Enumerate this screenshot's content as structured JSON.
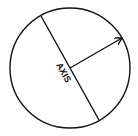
{
  "diagram": {
    "label": "AXIS",
    "stroke_color": "#111111",
    "background": "#ffffff",
    "circle": {
      "cx": 70,
      "cy": 68,
      "r": 60
    },
    "axis_line": {
      "x1": 41,
      "y1": 16,
      "x2": 99,
      "y2": 120
    },
    "arrow": {
      "x1": 70,
      "y1": 68,
      "x2": 122,
      "y2": 38
    }
  }
}
